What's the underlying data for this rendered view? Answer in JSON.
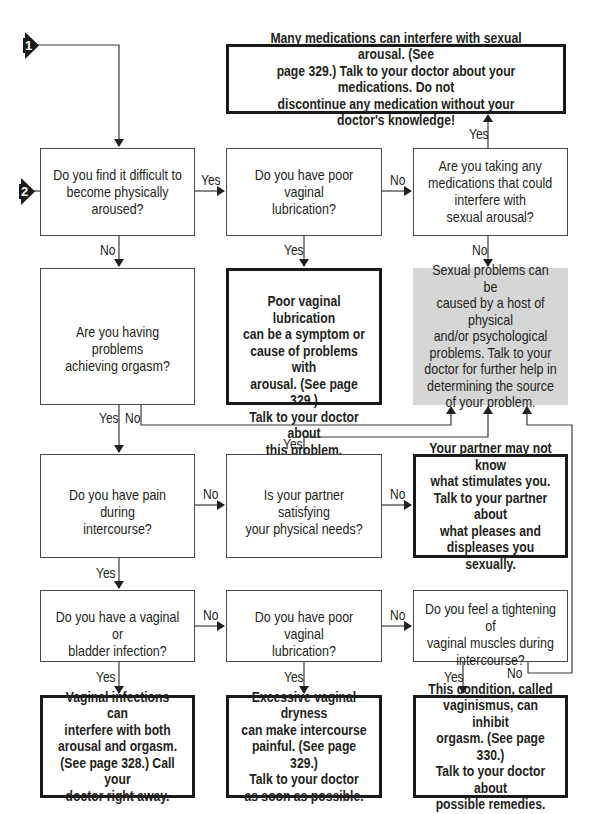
{
  "entry_markers": [
    {
      "label": "1"
    },
    {
      "label": "2"
    }
  ],
  "questions": {
    "aroused": "Do you find it difficult to\nbecome physically aroused?",
    "lubrication_top": "Do you have poor vaginal\nlubrication?",
    "medications": "Are you taking any\nmedications that could\ninterfere with\nsexual arousal?",
    "orgasm": "Are you having problems\nachieving orgasm?",
    "pain": "Do you have pain during\nintercourse?",
    "partner": "Is your partner satisfying\nyour physical needs?",
    "infection": "Do you have a vaginal or\nbladder infection?",
    "lubrication_bottom": "Do you have poor vaginal\nlubrication?",
    "tightening": "Do you feel a tightening of\nvaginal muscles during\nintercourse?"
  },
  "answers": {
    "medications": "Many medications can interfere with sexual arousal. (See\npage 329.) Talk to your doctor about your medications. Do not\ndiscontinue any medication without your doctor's knowledge!",
    "lubrication": "Poor vaginal lubrication\ncan be a symptom or\ncause of problems with\narousal. (See page 329.)\nTalk to your doctor about\nthis problem.",
    "general": "Sexual problems can be\ncaused by a host of physical\nand/or psychological\nproblems. Talk to your\ndoctor for further help in\ndetermining the source\nof your problem.",
    "partner": "Your partner may not know\nwhat stimulates you.\nTalk to your partner about\nwhat pleases and\ndispleases you sexually.",
    "infection": "Vaginal infections can\ninterfere with both\narousal and orgasm.\n(See page 328.) Call your\ndoctor right away.",
    "dryness": "Excessive vaginal dryness\ncan make intercourse\npainful. (See page 329.)\nTalk to your doctor\nas soon as possible.",
    "vaginismus": "This condition, called\nvaginismus, can inhibit\norgasm. (See page 330.)\nTalk to your doctor about\npossible remedies."
  },
  "edge_labels": {
    "yes": "Yes",
    "no": "No"
  },
  "colors": {
    "line": "#3a3a3a",
    "general_box_fill": "#d6d6d6",
    "answer_border": "#1a1a1a"
  }
}
